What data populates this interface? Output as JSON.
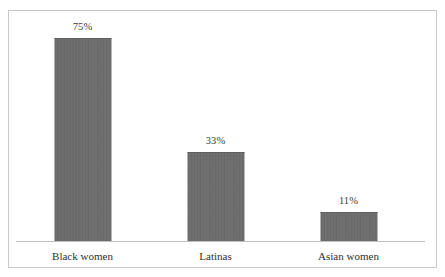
{
  "chart_data": {
    "type": "bar",
    "title": "",
    "subtitle": "",
    "xlabel": "",
    "ylabel": "",
    "categories": [
      "Black women",
      "Latinas",
      "Asian women"
    ],
    "values": [
      75,
      33,
      11
    ],
    "value_labels": [
      "75%",
      "33%",
      "11%"
    ],
    "unit": "%",
    "ylim": [
      0,
      83
    ],
    "grid": false,
    "legend": false,
    "legend_position": "none",
    "axis_visible": {
      "x_baseline": true,
      "y_axis": false,
      "y_tick_labels": false
    },
    "series": [
      {
        "name": "",
        "values": [
          75,
          33,
          11
        ]
      }
    ],
    "bar_color": "#6c6c6c",
    "frame_color": "#c9c9c9",
    "axis_color": "#bfbfbf",
    "label_color": "#2f2f2f",
    "value_label_color": "#3b3b3b"
  }
}
